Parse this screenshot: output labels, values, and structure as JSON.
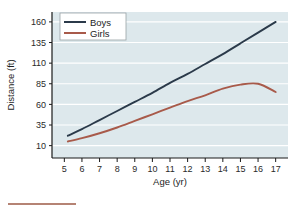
{
  "chart_data": {
    "type": "line",
    "title": "",
    "xlabel": "Age (yr)",
    "ylabel": "Distance (ft)",
    "xlim": [
      4.3,
      17.7
    ],
    "ylim": [
      -5,
      172
    ],
    "grid": true,
    "legend_position": "top-left",
    "xticks": [
      "5",
      "6",
      "7",
      "8",
      "9",
      "10",
      "11",
      "12",
      "13",
      "14",
      "15",
      "16",
      "17"
    ],
    "yticks": [
      "10",
      "35",
      "60",
      "85",
      "110",
      "135",
      "160"
    ],
    "x": [
      5.2,
      6,
      7,
      8,
      9,
      10,
      11,
      12,
      13,
      14,
      15,
      16,
      17
    ],
    "series": [
      {
        "name": "Boys",
        "color": "#2b3a4a",
        "values": [
          22,
          30,
          41,
          52,
          63,
          74,
          86,
          97,
          109,
          121,
          134,
          147,
          160
        ]
      },
      {
        "name": "Girls",
        "color": "#a85a4a",
        "values": [
          15,
          19,
          25,
          32,
          40,
          48,
          56,
          64,
          71,
          79,
          84,
          85,
          75
        ]
      }
    ]
  },
  "legend": {
    "entries": [
      {
        "label": "Boys",
        "color": "#2b3a4a"
      },
      {
        "label": "Girls",
        "color": "#a85a4a"
      }
    ]
  },
  "style": {
    "plot_background": "#dde8ec",
    "gridline_color": "#ffffff",
    "axis_color": "#1a1a1a",
    "page_background": "#ffffff",
    "footer_rule_color": "#9d5a46"
  },
  "footer": {
    "rule_label": "footer-rule"
  }
}
